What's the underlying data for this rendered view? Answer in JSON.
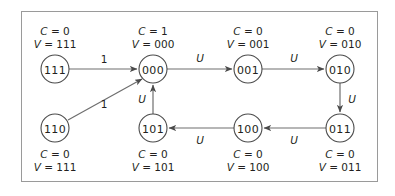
{
  "figure": {
    "frame_color": "#9a9a9a",
    "background": "#ffffff",
    "node_stroke": "#4a4a4a",
    "edge_stroke": "#6e6e6e",
    "text_color": "#231f20"
  },
  "nodes": [
    {
      "id": "111",
      "label": "111",
      "cx": 55,
      "cy": 69,
      "r": 14,
      "annotation_position": "above",
      "ann_x": 55,
      "ann_y": 25,
      "c_var": "C",
      "c_eq": "= 0",
      "v_var": "V",
      "v_eq": "= 111"
    },
    {
      "id": "000",
      "label": "000",
      "cx": 153,
      "cy": 69,
      "r": 14,
      "annotation_position": "above",
      "ann_x": 153,
      "ann_y": 25,
      "c_var": "C",
      "c_eq": "= 1",
      "v_var": "V",
      "v_eq": "= 000"
    },
    {
      "id": "001",
      "label": "001",
      "cx": 248,
      "cy": 69,
      "r": 14,
      "annotation_position": "above",
      "ann_x": 248,
      "ann_y": 25,
      "c_var": "C",
      "c_eq": "= 0",
      "v_var": "V",
      "v_eq": "= 001"
    },
    {
      "id": "010",
      "label": "010",
      "cx": 340,
      "cy": 69,
      "r": 14,
      "annotation_position": "above",
      "ann_x": 340,
      "ann_y": 25,
      "c_var": "C",
      "c_eq": "= 0",
      "v_var": "V",
      "v_eq": "= 010"
    },
    {
      "id": "110",
      "label": "110",
      "cx": 55,
      "cy": 128,
      "r": 14,
      "annotation_position": "below",
      "ann_x": 55,
      "ann_y": 148,
      "c_var": "C",
      "c_eq": "= 0",
      "v_var": "V",
      "v_eq": "= 111"
    },
    {
      "id": "101",
      "label": "101",
      "cx": 153,
      "cy": 128,
      "r": 14,
      "annotation_position": "below",
      "ann_x": 153,
      "ann_y": 148,
      "c_var": "C",
      "c_eq": "= 0",
      "v_var": "V",
      "v_eq": "= 101"
    },
    {
      "id": "100",
      "label": "100",
      "cx": 248,
      "cy": 128,
      "r": 14,
      "annotation_position": "below",
      "ann_x": 248,
      "ann_y": 148,
      "c_var": "C",
      "c_eq": "= 0",
      "v_var": "V",
      "v_eq": "= 100"
    },
    {
      "id": "011",
      "label": "011",
      "cx": 340,
      "cy": 128,
      "r": 14,
      "annotation_position": "below",
      "ann_x": 340,
      "ann_y": 148,
      "c_var": "C",
      "c_eq": "= 0",
      "v_var": "V",
      "v_eq": "= 011"
    }
  ],
  "edges": [
    {
      "id": "e-111-000",
      "from": "111",
      "to": "000",
      "label": "1",
      "italic": false,
      "lx": 104,
      "ly": 59,
      "path": "M 69 69 L 137 69"
    },
    {
      "id": "e-110-000",
      "from": "110",
      "to": "000",
      "label": "1",
      "italic": false,
      "lx": 104,
      "ly": 104,
      "path": "M 68 120 L 142 79"
    },
    {
      "id": "e-000-001",
      "from": "000",
      "to": "001",
      "label": "U",
      "italic": true,
      "lx": 200,
      "ly": 58,
      "path": "M 167 69 L 232 69"
    },
    {
      "id": "e-001-010",
      "from": "001",
      "to": "010",
      "label": "U",
      "italic": true,
      "lx": 294,
      "ly": 58,
      "path": "M 262 69 L 324 69"
    },
    {
      "id": "e-010-011",
      "from": "010",
      "to": "011",
      "label": "U",
      "italic": true,
      "lx": 352,
      "ly": 99,
      "path": "M 340 83 L 340 112"
    },
    {
      "id": "e-011-100",
      "from": "011",
      "to": "100",
      "label": "U",
      "italic": true,
      "lx": 294,
      "ly": 140,
      "path": "M 326 128 L 264 128"
    },
    {
      "id": "e-100-101",
      "from": "100",
      "to": "101",
      "label": "U",
      "italic": true,
      "lx": 200,
      "ly": 140,
      "path": "M 234 128 L 169 128"
    },
    {
      "id": "e-101-000",
      "from": "101",
      "to": "000",
      "label": "U",
      "italic": true,
      "lx": 142,
      "ly": 99,
      "path": "M 153 114 L 153 85"
    }
  ]
}
